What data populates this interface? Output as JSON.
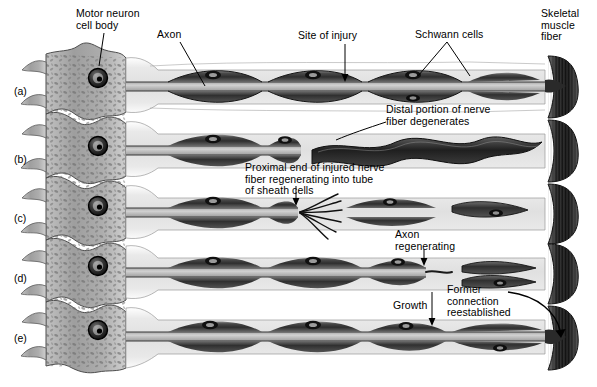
{
  "figure": {
    "panel_letters": [
      "(a)",
      "(b)",
      "(c)",
      "(d)",
      "(e)"
    ]
  },
  "labels": {
    "motor_neuron_cell_body": "Motor neuron\ncell body",
    "axon": "Axon",
    "site_of_injury": "Site of injury",
    "schwann_cells": "Schwann cells",
    "skeletal_muscle_fiber": "Skeletal\nmuscle\nfiber",
    "distal_degenerates": "Distal portion of nerve\nfiber degenerates",
    "proximal_regenerating": "Proximal end of injured nerve\nfiber regenerating into tube\nof sheath cells",
    "axon_regenerating": "Axon\nregenerating",
    "growth": "Growth",
    "former_connection": "Former\nconnection\nreestablished"
  },
  "colors": {
    "background": "#ffffff",
    "text": "#000000",
    "endoneurium_light": "#e3e3e3",
    "endoneurium_mid": "#cfcfcf",
    "myelin_dark": "#3c3c3c",
    "myelin_mid": "#6f6f6f",
    "axon_core": "#bdbdbd",
    "cell_body": "#a8a8a8",
    "cell_body_dark": "#7d7d7d",
    "nucleus": "#1e1e1e",
    "muscle_dark": "#2b2b2b",
    "leader_line": "#000000"
  },
  "panels": [
    {
      "letter": "(a)",
      "state": "intact nerve fiber with motor neuron, axon, Schwann cells and muscle fiber",
      "y": 85
    },
    {
      "letter": "(b)",
      "state": "distal portion of nerve fiber degenerates after injury",
      "y": 153
    },
    {
      "letter": "(c)",
      "state": "proximal end of injured nerve fiber regenerating into tube of sheath cells",
      "y": 212
    },
    {
      "letter": "(d)",
      "state": "axon regenerating and growing toward muscle",
      "y": 272
    },
    {
      "letter": "(e)",
      "state": "former connection reestablished",
      "y": 332
    }
  ],
  "label_positions": {
    "motor_neuron_cell_body": {
      "x": 76,
      "y": 8
    },
    "axon": {
      "x": 157,
      "y": 29
    },
    "site_of_injury": {
      "x": 298,
      "y": 30
    },
    "schwann_cells": {
      "x": 415,
      "y": 29
    },
    "skeletal_muscle_fiber": {
      "x": 541,
      "y": 8
    },
    "distal_degenerates": {
      "x": 386,
      "y": 104
    },
    "proximal_regenerating": {
      "x": 245,
      "y": 162
    },
    "axon_regenerating": {
      "x": 395,
      "y": 229
    },
    "growth": {
      "x": 393,
      "y": 300
    },
    "former_connection": {
      "x": 447,
      "y": 284
    }
  }
}
